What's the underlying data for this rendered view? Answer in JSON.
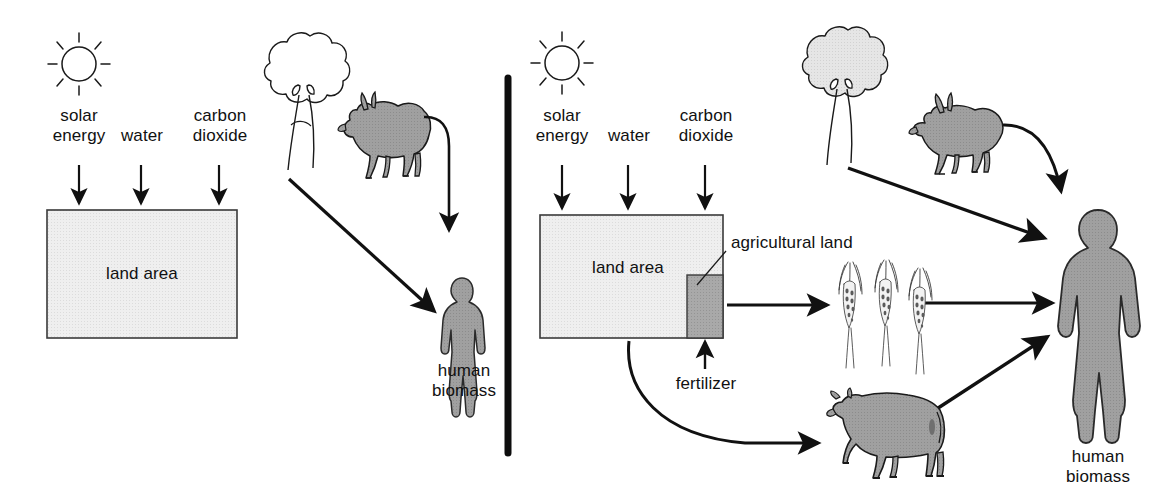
{
  "figure": {
    "type": "diagram",
    "divider": "vertical-black-bar",
    "colors": {
      "land_area_fill": "#eaeaea",
      "agricultural_land_fill": "#a8a8a8",
      "animal_fill": "#9d9d9d",
      "tree_fill_left": "#ffffff",
      "tree_fill_right": "#e2e2e2",
      "human_fill_left": "#a6a6a6",
      "human_fill_right": "#9d9d9d",
      "stroke": "#1a1a1a",
      "text": "#111111"
    }
  },
  "panels": [
    {
      "id": "left-panel",
      "name": "hunter-gatherer-panel",
      "inputs": [
        {
          "id": "solar",
          "label": "solar\nenergy",
          "icon": "sun-icon"
        },
        {
          "id": "water",
          "label": "water",
          "icon": "none"
        },
        {
          "id": "co2",
          "label": "carbon\ndioxide",
          "icon": "none"
        }
      ],
      "land": {
        "label": "land area"
      },
      "organisms": [
        {
          "id": "tree",
          "icon": "tree-icon",
          "filled": false
        },
        {
          "id": "goat",
          "icon": "goat-icon",
          "filled": true
        }
      ],
      "output": {
        "label": "human\nbiomass",
        "icon": "human-figure-icon"
      },
      "flows": [
        {
          "from": "solar",
          "to": "land area",
          "style": "straight-down"
        },
        {
          "from": "water",
          "to": "land area",
          "style": "straight-down"
        },
        {
          "from": "carbon dioxide",
          "to": "land area",
          "style": "straight-down"
        },
        {
          "from": "tree",
          "to": "human biomass",
          "style": "diagonal"
        },
        {
          "from": "goat",
          "to": "human biomass",
          "style": "curved-down"
        }
      ]
    },
    {
      "id": "right-panel",
      "name": "agricultural-panel",
      "inputs": [
        {
          "id": "solar",
          "label": "solar\nenergy",
          "icon": "sun-icon"
        },
        {
          "id": "water",
          "label": "water",
          "icon": "none"
        },
        {
          "id": "co2",
          "label": "carbon\ndioxide",
          "icon": "none"
        }
      ],
      "land": {
        "label": "land area"
      },
      "sub_land": {
        "label": "agricultural land"
      },
      "fertilizer": {
        "label": "fertilizer"
      },
      "organisms": [
        {
          "id": "tree",
          "icon": "tree-icon",
          "filled": true
        },
        {
          "id": "goat",
          "icon": "goat-icon",
          "filled": true
        },
        {
          "id": "wheat",
          "icon": "wheat-icon",
          "count": 3
        },
        {
          "id": "cow",
          "icon": "cow-icon",
          "filled": true
        }
      ],
      "output": {
        "label": "human\nbiomass",
        "icon": "human-figure-icon"
      },
      "flows": [
        {
          "from": "solar",
          "to": "land area",
          "style": "straight-down"
        },
        {
          "from": "water",
          "to": "land area",
          "style": "straight-down"
        },
        {
          "from": "carbon dioxide",
          "to": "land area",
          "style": "straight-down"
        },
        {
          "from": "fertilizer",
          "to": "agricultural land",
          "style": "straight-up"
        },
        {
          "from": "agricultural land",
          "to": "wheat",
          "style": "straight-right"
        },
        {
          "from": "wheat",
          "to": "human biomass",
          "style": "straight-right"
        },
        {
          "from": "land area",
          "to": "cow",
          "style": "curved"
        },
        {
          "from": "cow",
          "to": "human biomass",
          "style": "diagonal-up"
        },
        {
          "from": "tree",
          "to": "human biomass",
          "style": "diagonal-down"
        },
        {
          "from": "goat",
          "to": "human biomass",
          "style": "curved-down"
        }
      ]
    }
  ],
  "labels": {
    "left": {
      "solar_energy": "solar\nenergy",
      "water": "water",
      "carbon_dioxide": "carbon\ndioxide",
      "land_area": "land area",
      "human_biomass": "human\nbiomass"
    },
    "right": {
      "solar_energy": "solar\nenergy",
      "water": "water",
      "carbon_dioxide": "carbon\ndioxide",
      "land_area": "land area",
      "agricultural_land": "agricultural land",
      "fertilizer": "fertilizer",
      "human_biomass": "human\nbiomass"
    }
  }
}
